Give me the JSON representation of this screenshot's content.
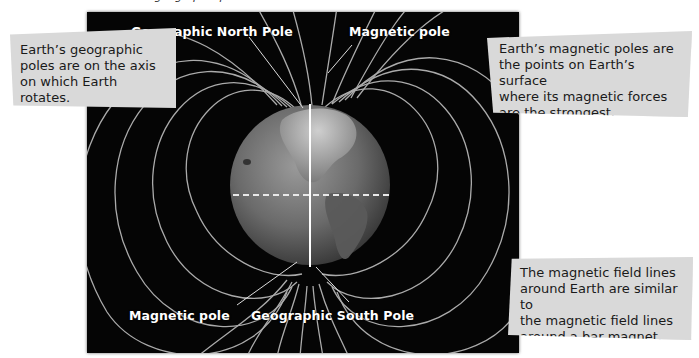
{
  "figure": {
    "cropped_heading": "… geographic poles …",
    "labels": {
      "geographic_north": "Geographic North Pole",
      "magnetic_pole_top": "Magnetic pole",
      "magnetic_pole_bottom": "Magnetic pole",
      "geographic_south": "Geographic South Pole"
    },
    "callouts": {
      "geographic": {
        "lines": [
          "Earth’s geographic",
          "poles are on the axis",
          "on which Earth rotates."
        ]
      },
      "magnetic": {
        "lines": [
          "Earth’s magnetic poles are",
          "the points on Earth’s surface",
          "where its magnetic forces",
          "are the strongest."
        ]
      },
      "field_lines": {
        "lines": [
          "The magnetic field lines",
          "around Earth are similar to",
          "the magnetic field lines",
          "around a bar magnet."
        ]
      }
    },
    "colors": {
      "panel_bg": "#050505",
      "field_line": "#bdbdbd",
      "axis": "#ffffff",
      "callout_bg": "#d9d9d9"
    }
  }
}
